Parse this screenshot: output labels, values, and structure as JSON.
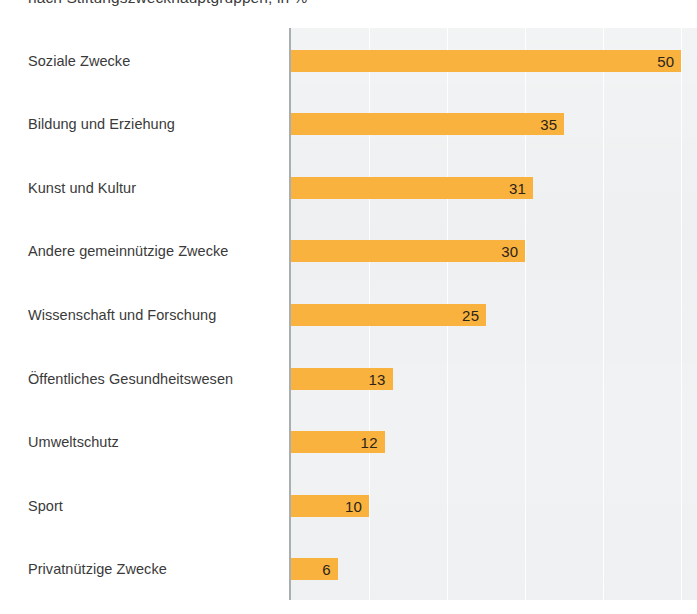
{
  "chart_data": {
    "type": "bar",
    "orientation": "horizontal",
    "title": "nach Stiftungszweckhauptgruppen, in %",
    "xlabel": "",
    "ylabel": "",
    "xlim": [
      0,
      52
    ],
    "grid": true,
    "grid_axis": "x",
    "gridline_values": [
      10,
      20,
      30,
      40,
      50
    ],
    "legend": false,
    "value_label_position": "inside-end",
    "bar_color": "#f9b23e",
    "plot_background": "#edeff0",
    "axis_line_color": "#a9aeb1",
    "label_color": "#3a3a3a",
    "value_color": "#2c2419",
    "categories": [
      "Soziale Zwecke",
      "Bildung und Erziehung",
      "Kunst und Kultur",
      "Andere gemeinnützige Zwecke",
      "Wissenschaft und Forschung",
      "Öffentliches Gesundheitswesen",
      "Umweltschutz",
      "Sport",
      "Privatnützige Zwecke"
    ],
    "values": [
      50,
      35,
      31,
      30,
      25,
      13,
      12,
      10,
      6
    ],
    "value_labels": [
      "50",
      "35",
      "31",
      "30",
      "25",
      "13",
      "12",
      "10",
      "6"
    ]
  }
}
